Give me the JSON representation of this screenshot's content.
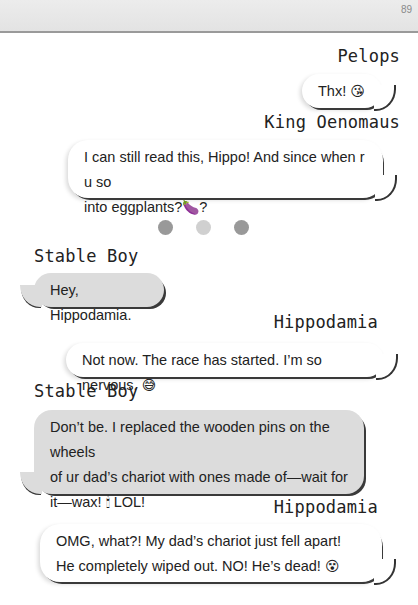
{
  "page": {
    "number": "89"
  },
  "messages": [
    {
      "sender": "Pelops",
      "direction": "outgoing",
      "text": "Thx!",
      "emoji": "😘"
    },
    {
      "sender": "King Oenomaus",
      "direction": "outgoing",
      "text_line1": "I can still read this, Hippo! And since when r u so",
      "text_line2": "into eggplants?",
      "emoji": "🍆",
      "suffix": "?"
    },
    {
      "sender": "Stable Boy",
      "direction": "incoming",
      "text": "Hey, Hippodamia."
    },
    {
      "sender": "Hippodamia",
      "direction": "outgoing",
      "text": "Not now. The race has started. I’m so nervous.",
      "emoji": "😅"
    },
    {
      "sender": "Stable Boy",
      "direction": "incoming",
      "text_line1": "Don’t be. I replaced the wooden pins on the wheels",
      "text_line2": "of ur dad’s chariot with ones made of—wait for",
      "text_line3": "it—wax!",
      "emoji": "🕯",
      "suffix": " LOL!"
    },
    {
      "sender": "Hippodamia",
      "direction": "outgoing",
      "text_line1": "OMG, what?! My dad’s chariot just fell apart!",
      "text_line2": "He completely wiped out. NO! He’s dead!",
      "emoji": "😵"
    }
  ],
  "divider": {
    "type": "three-dots",
    "colors": [
      "#999999",
      "#d0d0d0",
      "#999999"
    ]
  },
  "colors": {
    "outgoing_bubble": "#ffffff",
    "incoming_bubble": "#dcdcdc",
    "shadow": "#3a3a3a"
  }
}
